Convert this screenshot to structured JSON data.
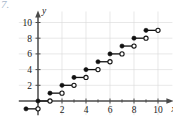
{
  "figure": {
    "problem_number": "7.",
    "problem_number_color": "#a8b8cc",
    "background_color": "#ffffff",
    "width": 173,
    "height": 117
  },
  "chart_data": {
    "type": "line",
    "subtype": "step-function",
    "title": "",
    "xlabel": "x",
    "ylabel": "y",
    "xlim": [
      -1.6,
      11.2
    ],
    "ylim": [
      -1.8,
      11.4
    ],
    "grid": true,
    "legend": null,
    "xticks": [
      2,
      4,
      6,
      8,
      10
    ],
    "xtick_labels": [
      "2",
      "4",
      "6",
      "8",
      "10"
    ],
    "yticks": [
      2,
      4,
      6,
      8,
      10
    ],
    "ytick_labels": [
      "2",
      "4",
      "6",
      "8",
      "10"
    ],
    "minor_xticks": [
      1,
      3,
      5,
      7,
      9
    ],
    "steps": [
      {
        "x_start": -1,
        "x_end": 0,
        "y": -1,
        "left_endpoint": "closed",
        "right_endpoint": "open"
      },
      {
        "x_start": 0,
        "x_end": 1,
        "y": 0,
        "left_endpoint": "closed",
        "right_endpoint": "open"
      },
      {
        "x_start": 1,
        "x_end": 2,
        "y": 1,
        "left_endpoint": "closed",
        "right_endpoint": "open"
      },
      {
        "x_start": 2,
        "x_end": 3,
        "y": 2,
        "left_endpoint": "closed",
        "right_endpoint": "open"
      },
      {
        "x_start": 3,
        "x_end": 4,
        "y": 3,
        "left_endpoint": "closed",
        "right_endpoint": "open"
      },
      {
        "x_start": 4,
        "x_end": 5,
        "y": 4,
        "left_endpoint": "closed",
        "right_endpoint": "open"
      },
      {
        "x_start": 5,
        "x_end": 6,
        "y": 5,
        "left_endpoint": "closed",
        "right_endpoint": "open"
      },
      {
        "x_start": 6,
        "x_end": 7,
        "y": 6,
        "left_endpoint": "closed",
        "right_endpoint": "open"
      },
      {
        "x_start": 7,
        "x_end": 8,
        "y": 7,
        "left_endpoint": "closed",
        "right_endpoint": "open"
      },
      {
        "x_start": 8,
        "x_end": 9,
        "y": 8,
        "left_endpoint": "closed",
        "right_endpoint": "open"
      },
      {
        "x_start": 9,
        "x_end": 10,
        "y": 9,
        "left_endpoint": "closed",
        "right_endpoint": "open"
      }
    ],
    "colors": {
      "curve": "#111111",
      "axis": "#4a4a4a",
      "grid": "#d8d8d8",
      "text": "#1a1a1a"
    }
  }
}
